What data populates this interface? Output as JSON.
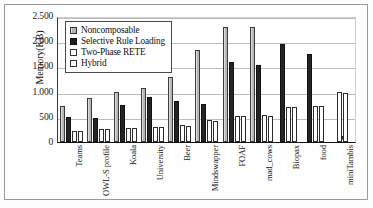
{
  "chart_data": {
    "type": "bar",
    "title": "",
    "xlabel": "",
    "ylabel": "Memory(KB)",
    "ylim": [
      0,
      2500
    ],
    "yticks": [
      0,
      500,
      1000,
      1500,
      2000,
      2500
    ],
    "ytick_labels": [
      "0",
      "500",
      "1.000",
      "1.500",
      "2.000",
      "2.500"
    ],
    "grid": true,
    "legend_position": "upper-left-inside",
    "missing_marker": "x",
    "categories": [
      "Teams",
      "OWL-S profile",
      "Koala",
      "University",
      "Beer",
      "Mindswapper",
      "FOAF",
      "mad_cows",
      "Biopax",
      "food",
      "miniTambis"
    ],
    "series": [
      {
        "name": "Noncomposable",
        "color": "#b6b6b6",
        "values": [
          720,
          865,
          1000,
          1080,
          1290,
          1825,
          2285,
          2275,
          null,
          null,
          null
        ]
      },
      {
        "name": "Selective Rule Loading",
        "color": "#242424",
        "values": [
          500,
          475,
          740,
          890,
          810,
          745,
          1595,
          1535,
          1935,
          1740,
          null
        ]
      },
      {
        "name": "Two-Phase RETE",
        "color": "#ffffff",
        "values": [
          225,
          265,
          280,
          300,
          335,
          430,
          520,
          530,
          695,
          715,
          985
        ]
      },
      {
        "name": "Hybrid",
        "color": "#ffffff",
        "values": [
          220,
          250,
          275,
          295,
          320,
          420,
          515,
          515,
          690,
          710,
          965
        ]
      }
    ]
  },
  "legend": {
    "items": [
      {
        "label": "Noncomposable"
      },
      {
        "label": "Selective Rule Loading"
      },
      {
        "label": "Two-Phase RETE"
      },
      {
        "label": "Hybrid"
      }
    ]
  }
}
